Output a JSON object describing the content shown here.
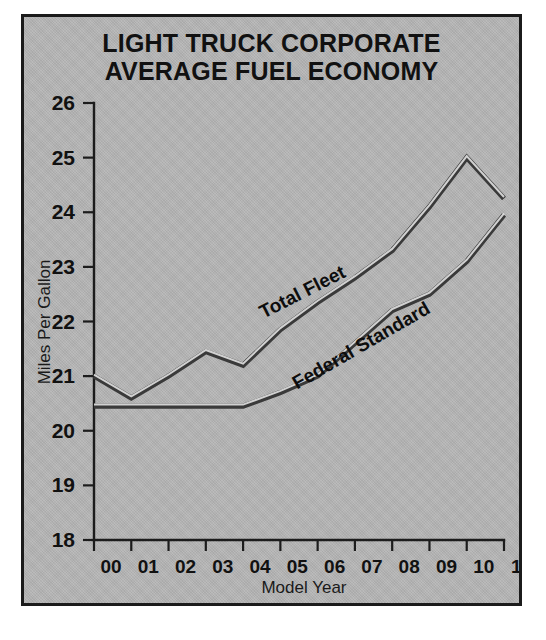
{
  "figure": {
    "background_color": "#ffffff",
    "panel_color": "#b6b6b6",
    "border_color": "#1b1b1b",
    "line_color": "#3a3a3a"
  },
  "title": {
    "line1": "LIGHT TRUCK CORPORATE",
    "line2": "AVERAGE FUEL ECONOMY"
  },
  "chart_data": {
    "type": "line",
    "title": "LIGHT TRUCK CORPORATE AVERAGE FUEL ECONOMY",
    "xlabel": "Model Year",
    "ylabel": "Miles Per Gallon",
    "xlim": [
      0,
      11
    ],
    "ylim": [
      18,
      26
    ],
    "ytick_labels": [
      "26",
      "25",
      "24",
      "23",
      "22",
      "21",
      "20",
      "19",
      "18"
    ],
    "ytick_values": [
      26,
      25,
      24,
      23,
      22,
      21,
      20,
      19,
      18
    ],
    "xtick_labels": [
      "00",
      "01",
      "02",
      "03",
      "04",
      "05",
      "06",
      "07",
      "08",
      "09",
      "10",
      "11"
    ],
    "x": [
      0,
      1,
      2,
      3,
      4,
      5,
      6,
      7,
      8,
      9,
      10,
      11
    ],
    "grid": false,
    "legend": "inline-annotation",
    "series": [
      {
        "name": "Total Fleet",
        "label_x": 4.55,
        "label_y": 22.05,
        "label_rotation": -27,
        "values": [
          21.0,
          20.6,
          21.0,
          21.45,
          21.2,
          21.85,
          22.35,
          22.8,
          23.3,
          24.1,
          25.0,
          24.25
        ]
      },
      {
        "name": "Federal Standard",
        "label_x": 5.45,
        "label_y": 20.75,
        "label_rotation": -30,
        "values": [
          20.45,
          20.45,
          20.45,
          20.45,
          20.45,
          20.7,
          21.0,
          21.6,
          22.2,
          22.5,
          23.1,
          23.95
        ]
      }
    ]
  }
}
